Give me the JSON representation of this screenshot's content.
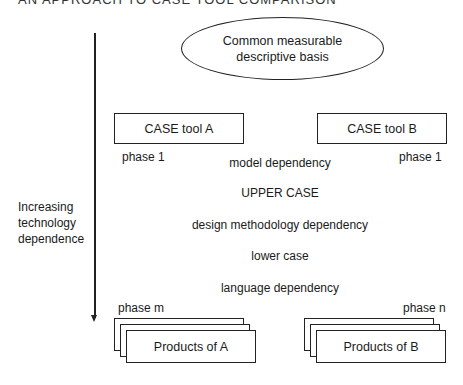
{
  "header_cutoff": "AN APPROACH TO CASE TOOL COMPARISON",
  "ellipse": {
    "line1": "Common measurable",
    "line2": "descriptive basis"
  },
  "tools": {
    "a": {
      "label": "CASE tool A",
      "phase_start": "phase 1",
      "phase_end": "phase m",
      "products": "Products of A"
    },
    "b": {
      "label": "CASE tool B",
      "phase_start": "phase 1",
      "phase_end": "phase n",
      "products": "Products of B"
    }
  },
  "levels": [
    "model dependency",
    "UPPER CASE",
    "design methodology dependency",
    "lower case",
    "language dependency"
  ],
  "axis": {
    "line1": "Increasing",
    "line2": "technology",
    "line3": "dependence"
  }
}
